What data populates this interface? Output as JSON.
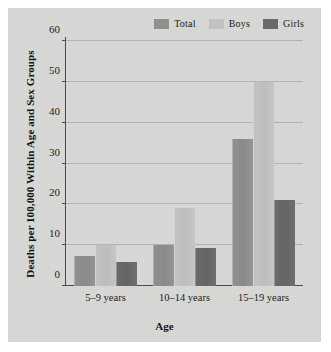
{
  "chart_data": {
    "type": "bar",
    "title": "",
    "xlabel": "Age",
    "ylabel": "Deaths per 100,000 Within Age and Sex Groups",
    "categories": [
      "5–9 years",
      "10–14 years",
      "15–19 years"
    ],
    "series": [
      {
        "name": "Total",
        "color": "#8f8f8f",
        "values": [
          7.3,
          10.0,
          36.0
        ]
      },
      {
        "name": "Boys",
        "color": "#c2c2c0",
        "values": [
          10.0,
          19.0,
          50.0
        ]
      },
      {
        "name": "Girls",
        "color": "#6a6a6a",
        "values": [
          6.0,
          9.3,
          21.0
        ]
      }
    ],
    "ylim": [
      0,
      60
    ],
    "yticks": [
      0,
      10,
      20,
      30,
      40,
      50,
      60
    ],
    "ytick_labels": [
      "0",
      "10",
      "20",
      "30",
      "40",
      "50",
      "60"
    ],
    "grid": true,
    "legend_position": "top-right"
  }
}
